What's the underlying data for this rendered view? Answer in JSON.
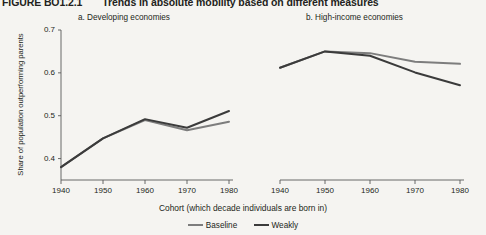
{
  "figure": {
    "number": "FIGURE BO1.2.1",
    "title": "Trends in absolute mobility based on different measures"
  },
  "panels": {
    "a_label": "a. Developing economies",
    "b_label": "b. High-income economies"
  },
  "axes": {
    "ylabel": "Share of population outperforming parents",
    "xlabel": "Cohort (which decade individuals are born in)",
    "yticks": [
      "0.4",
      "0.5",
      "0.6",
      "0.7"
    ],
    "xticks": [
      "1940",
      "1950",
      "1960",
      "1970",
      "1980"
    ]
  },
  "legend": {
    "items": [
      {
        "label": "Baseline",
        "color": "#7d7d7d"
      },
      {
        "label": "Weakly",
        "color": "#3b3b3b"
      }
    ]
  },
  "colors": {
    "baseline": "#7d7d7d",
    "weakly": "#3b3b3b",
    "axis": "#5a5a5a",
    "background": "#f5f4f1"
  },
  "chart_data": [
    {
      "type": "line",
      "title": "a. Developing economies",
      "xlabel": "Cohort (which decade individuals are born in)",
      "ylabel": "Share of population outperforming parents",
      "x": [
        1940,
        1950,
        1960,
        1970,
        1980
      ],
      "xlim": [
        1940,
        1980
      ],
      "ylim": [
        0.35,
        0.7
      ],
      "yticks": [
        0.4,
        0.5,
        0.6,
        0.7
      ],
      "grid": false,
      "legend_position": "bottom-center",
      "series": [
        {
          "name": "Baseline",
          "values": [
            0.38,
            0.447,
            0.49,
            0.466,
            0.486
          ]
        },
        {
          "name": "Weakly",
          "values": [
            0.38,
            0.447,
            0.492,
            0.472,
            0.511
          ]
        }
      ]
    },
    {
      "type": "line",
      "title": "b. High-income economies",
      "xlabel": "Cohort (which decade individuals are born in)",
      "ylabel": "Share of population outperforming parents",
      "x": [
        1940,
        1950,
        1960,
        1970,
        1980
      ],
      "xlim": [
        1940,
        1980
      ],
      "ylim": [
        0.35,
        0.7
      ],
      "yticks": [
        0.4,
        0.5,
        0.6,
        0.7
      ],
      "grid": false,
      "legend_position": "bottom-center",
      "series": [
        {
          "name": "Baseline",
          "values": [
            0.612,
            0.65,
            0.646,
            0.626,
            0.621
          ]
        },
        {
          "name": "Weakly",
          "values": [
            0.612,
            0.65,
            0.64,
            0.601,
            0.571
          ]
        }
      ]
    }
  ]
}
